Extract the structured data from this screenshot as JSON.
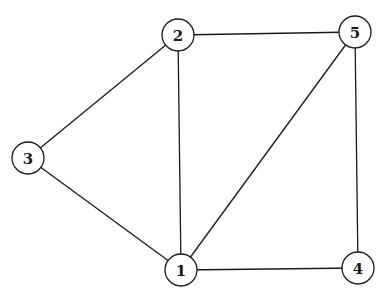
{
  "diagram": {
    "type": "undirected-graph",
    "background": "#ffffff",
    "stroke_color": "#1a1a1a",
    "node_radius": 16,
    "nodes": [
      {
        "id": "1",
        "label": "1",
        "x": 181,
        "y": 270
      },
      {
        "id": "2",
        "label": "2",
        "x": 178,
        "y": 35
      },
      {
        "id": "3",
        "label": "3",
        "x": 28,
        "y": 158
      },
      {
        "id": "4",
        "label": "4",
        "x": 358,
        "y": 268
      },
      {
        "id": "5",
        "label": "5",
        "x": 355,
        "y": 32
      }
    ],
    "edges": [
      {
        "from": "2",
        "to": "5"
      },
      {
        "from": "2",
        "to": "3"
      },
      {
        "from": "2",
        "to": "1"
      },
      {
        "from": "3",
        "to": "1"
      },
      {
        "from": "1",
        "to": "5"
      },
      {
        "from": "1",
        "to": "4"
      },
      {
        "from": "5",
        "to": "4"
      }
    ]
  }
}
